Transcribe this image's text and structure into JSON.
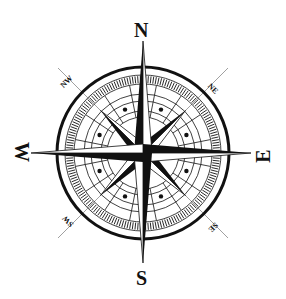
{
  "figure": {
    "colors": {
      "ink": "#111111",
      "background": "#ffffff",
      "guide": "#888888"
    },
    "geometry": {
      "cx": 143,
      "cy": 153,
      "outer_radius": 86
    }
  },
  "labels": {
    "cardinal": {
      "north": "N",
      "south": "S",
      "east": "E",
      "west": "W"
    },
    "intercardinal": {
      "northeast": "NE",
      "northwest": "NW",
      "southeast": "SE",
      "southwest": "SW"
    }
  }
}
